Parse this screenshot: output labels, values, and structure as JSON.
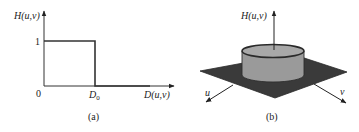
{
  "panel_a": {
    "caption": "(a)",
    "y_axis_label": "H(u,v)",
    "x_axis_label": "D(u,v)",
    "origin_label": "0",
    "y_tick_label": "1",
    "x_tick_label_main": "D",
    "x_tick_label_sub": "0",
    "line_color": "#333333"
  },
  "panel_b": {
    "caption": "(b)",
    "vertical_axis_label": "H(u,v)",
    "u_axis_label": "u",
    "v_axis_label": "v",
    "plane_color": "#3a3a3a",
    "cylinder_side_color": "#9a9a9a",
    "cylinder_top_color": "#b0b0b0"
  }
}
